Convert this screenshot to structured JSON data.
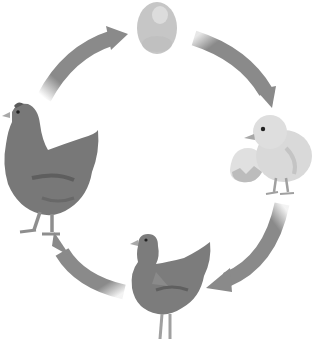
{
  "diagram": {
    "type": "cycle",
    "stages": [
      {
        "id": "egg",
        "label": "Egg",
        "position": "top"
      },
      {
        "id": "chick",
        "label": "Chick hatching from egg",
        "position": "right"
      },
      {
        "id": "young-hen",
        "label": "Young chicken",
        "position": "bottom"
      },
      {
        "id": "adult-hen",
        "label": "Adult hen",
        "position": "left"
      }
    ],
    "edges": [
      {
        "from": "egg",
        "to": "chick",
        "direction": "clockwise"
      },
      {
        "from": "chick",
        "to": "young-hen",
        "direction": "clockwise"
      },
      {
        "from": "young-hen",
        "to": "adult-hen",
        "direction": "clockwise"
      },
      {
        "from": "adult-hen",
        "to": "egg",
        "direction": "clockwise"
      }
    ],
    "colors": {
      "background": "#ffffff",
      "arrow": "#8a8a8a",
      "hen_body": "#7a7a7a",
      "hen_shadow": "#5e5e5e",
      "chick_body": "#d8d8d8",
      "egg": "#c8c8c8",
      "legs": "#9a9a9a"
    }
  }
}
